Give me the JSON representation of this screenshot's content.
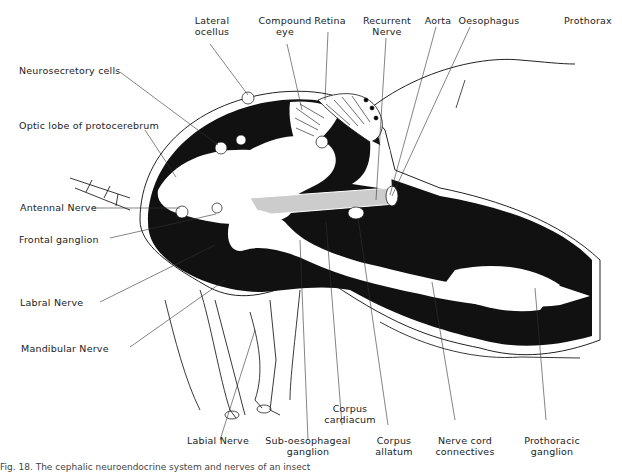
{
  "figure": {
    "caption": "Fig. 18. The cephalic neuroendocrine system and nerves of an insect",
    "labels": {
      "lateral_ocellus": [
        "Lateral",
        "ocellus"
      ],
      "compound_eye": [
        "Compound",
        "eye"
      ],
      "retina": "Retina",
      "recurrent_nerve": [
        "Recurrent",
        "Nerve"
      ],
      "aorta": "Aorta",
      "oesophagus": "Oesophagus",
      "prothorax": "Prothorax",
      "neurosecretory_cells": "Neurosecretory  cells",
      "optic_lobe": "Optic  lobe  of  protocerebrum",
      "antennal_nerve": "Antennal  Nerve",
      "frontal_ganglion": "Frontal  ganglion",
      "labral_nerve": "Labral  Nerve",
      "mandibular_nerve": "Mandibular  Nerve",
      "labial_nerve": "Labial  Nerve",
      "sub_oesophageal_ganglion": [
        "Sub-oesophageal",
        "ganglion"
      ],
      "corpus_cardiacum": [
        "Corpus",
        "cardiacum"
      ],
      "corpus_allatum": [
        "Corpus",
        "allatum"
      ],
      "nerve_cord_connectives": [
        "Nerve  cord",
        "connectives"
      ],
      "prothoracic_ganglion": [
        "Prothoracic",
        "ganglion"
      ]
    },
    "colors": {
      "ink": "#111111",
      "paper": "#ffffff",
      "leader": "#333333"
    }
  }
}
